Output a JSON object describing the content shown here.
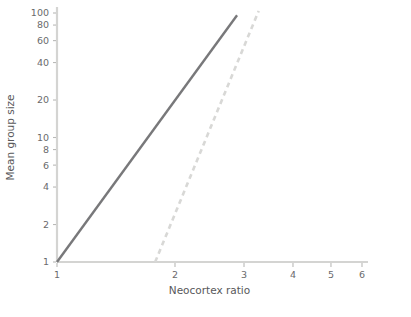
{
  "chart_data": {
    "type": "scatter",
    "title": "",
    "xlabel": "Neocortex ratio",
    "ylabel": "Mean group size",
    "xscale": "log",
    "yscale": "log",
    "xlim": [
      1,
      6
    ],
    "ylim": [
      1,
      100
    ],
    "grid": false,
    "xticks": [
      1,
      2,
      3,
      4,
      5,
      6
    ],
    "xtick_labels": [
      "1",
      "2",
      "3",
      "4",
      "5",
      "6"
    ],
    "yticks": [
      1,
      2,
      4,
      6,
      8,
      10,
      20,
      40,
      60,
      80,
      100
    ],
    "ytick_labels": [
      "1",
      "2",
      "4",
      "6",
      "8",
      "10",
      "20",
      "40",
      "60",
      "80",
      "100"
    ],
    "legend_position": "top-left",
    "series": [
      {
        "name": "Monkeys",
        "marker": "filled-circle",
        "color": "#7c7c7e",
        "points": [
          {
            "x": 1.72,
            "y": 5.0
          },
          {
            "x": 1.8,
            "y": 7.6
          },
          {
            "x": 1.82,
            "y": 4.0
          },
          {
            "x": 1.86,
            "y": 6.6
          },
          {
            "x": 1.9,
            "y": 3.4
          },
          {
            "x": 1.97,
            "y": 3.5
          },
          {
            "x": 1.99,
            "y": 11.0
          },
          {
            "x": 2.04,
            "y": 7.5
          },
          {
            "x": 2.11,
            "y": 22.0
          },
          {
            "x": 2.2,
            "y": 31.0
          },
          {
            "x": 2.26,
            "y": 36.0
          },
          {
            "x": 2.27,
            "y": 32.0
          },
          {
            "x": 2.28,
            "y": 16.0
          },
          {
            "x": 2.3,
            "y": 62.0
          },
          {
            "x": 2.39,
            "y": 11.5
          },
          {
            "x": 2.4,
            "y": 10.2
          },
          {
            "x": 2.41,
            "y": 9.2
          },
          {
            "x": 2.44,
            "y": 16.5
          },
          {
            "x": 2.53,
            "y": 26.0
          },
          {
            "x": 2.61,
            "y": 40.0
          },
          {
            "x": 2.69,
            "y": 50.0
          },
          {
            "x": 2.7,
            "y": 46.0
          }
        ]
      },
      {
        "name": "Apes",
        "marker": "open-circle",
        "color": "#ffffff",
        "points": [
          {
            "x": 2.15,
            "y": 3.5
          },
          {
            "x": 2.62,
            "y": 7.4
          },
          {
            "x": 3.18,
            "y": 53.0
          }
        ]
      }
    ],
    "lines": [
      {
        "name": "monkey-regression-line",
        "style": "solid",
        "color": "#78787a",
        "from": {
          "x": 1.0,
          "y": 1.0
        },
        "to": {
          "x": 2.88,
          "y": 96.0
        }
      },
      {
        "name": "ape-regression-line",
        "style": "dashed",
        "color": "#d8d8d6",
        "from": {
          "x": 1.78,
          "y": 1.0
        },
        "to": {
          "x": 3.27,
          "y": 104.0
        }
      }
    ]
  },
  "legend": {
    "items": [
      {
        "label": "Monkeys",
        "marker": "filled-circle"
      },
      {
        "label": "Apes",
        "marker": "open-circle"
      }
    ]
  },
  "axes": {
    "x_title": "Neocortex ratio",
    "y_title": "Mean group size"
  },
  "colors": {
    "marker_fill": "#7c7c7e",
    "solid_line": "#78787a",
    "dashed_line": "#d8d8d6",
    "axis": "#d4d4d2",
    "text": "#58585a"
  }
}
